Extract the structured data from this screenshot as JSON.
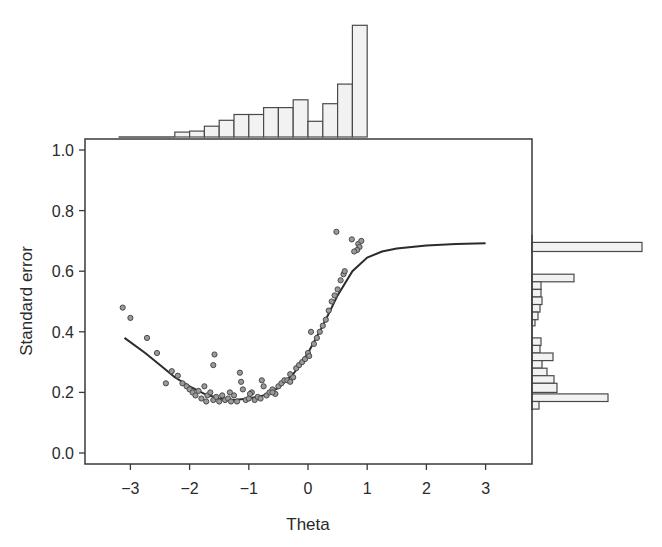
{
  "chart_data": {
    "type": "scatter",
    "title": "",
    "xlabel": "Theta",
    "ylabel": "Standard error",
    "xlim": [
      -3.75,
      3.77
    ],
    "ylim": [
      -0.04,
      1.035
    ],
    "xticks": [
      -3,
      -2,
      -1,
      0,
      1,
      2,
      3
    ],
    "xtick_labels": [
      "−3",
      "−2",
      "−1",
      "0",
      "1",
      "2",
      "3"
    ],
    "yticks": [
      0.0,
      0.2,
      0.4,
      0.6,
      0.8,
      1.0
    ],
    "ytick_labels": [
      "0.0",
      "0.2",
      "0.4",
      "0.6",
      "0.8",
      "1.0"
    ],
    "grid": false,
    "legend": null,
    "curve": {
      "name": "Theoretical standard error",
      "x": [
        -3.1,
        -2.75,
        -2.5,
        -2.25,
        -2.0,
        -1.75,
        -1.5,
        -1.25,
        -1.0,
        -0.75,
        -0.5,
        -0.25,
        0.0,
        0.25,
        0.5,
        0.75,
        1.0,
        1.25,
        1.5,
        2.0,
        2.5,
        3.0
      ],
      "y": [
        0.38,
        0.33,
        0.29,
        0.25,
        0.22,
        0.195,
        0.18,
        0.175,
        0.18,
        0.19,
        0.215,
        0.26,
        0.33,
        0.42,
        0.52,
        0.6,
        0.645,
        0.665,
        0.675,
        0.685,
        0.69,
        0.692
      ]
    },
    "scatter": {
      "name": "Estimated standard error",
      "points": [
        [
          -3.13,
          0.48
        ],
        [
          -3.0,
          0.446
        ],
        [
          -2.72,
          0.38
        ],
        [
          -2.55,
          0.33
        ],
        [
          -2.3,
          0.27
        ],
        [
          -2.2,
          0.255
        ],
        [
          -2.12,
          0.23
        ],
        [
          -2.05,
          0.22
        ],
        [
          -2.0,
          0.21
        ],
        [
          -1.95,
          0.2
        ],
        [
          -1.9,
          0.19
        ],
        [
          -1.85,
          0.205
        ],
        [
          -1.8,
          0.18
        ],
        [
          -1.75,
          0.22
        ],
        [
          -1.7,
          0.19
        ],
        [
          -1.65,
          0.2
        ],
        [
          -1.6,
          0.175
        ],
        [
          -1.58,
          0.325
        ],
        [
          -1.6,
          0.29
        ],
        [
          -1.55,
          0.185
        ],
        [
          -1.5,
          0.17
        ],
        [
          -1.45,
          0.19
        ],
        [
          -1.4,
          0.175
        ],
        [
          -1.35,
          0.18
        ],
        [
          -1.3,
          0.17
        ],
        [
          -1.25,
          0.19
        ],
        [
          -1.2,
          0.17
        ],
        [
          -1.15,
          0.265
        ],
        [
          -1.13,
          0.235
        ],
        [
          -1.1,
          0.21
        ],
        [
          -1.05,
          0.175
        ],
        [
          -1.0,
          0.18
        ],
        [
          -0.95,
          0.2
        ],
        [
          -0.9,
          0.175
        ],
        [
          -0.85,
          0.185
        ],
        [
          -0.8,
          0.18
        ],
        [
          -0.78,
          0.24
        ],
        [
          -0.75,
          0.22
        ],
        [
          -0.7,
          0.19
        ],
        [
          -0.65,
          0.2
        ],
        [
          -0.6,
          0.21
        ],
        [
          -0.55,
          0.195
        ],
        [
          -0.5,
          0.22
        ],
        [
          -0.45,
          0.23
        ],
        [
          -0.4,
          0.24
        ],
        [
          -0.35,
          0.24
        ],
        [
          -0.3,
          0.26
        ],
        [
          -0.25,
          0.25
        ],
        [
          -0.2,
          0.28
        ],
        [
          -0.15,
          0.29
        ],
        [
          -0.1,
          0.3
        ],
        [
          -0.05,
          0.31
        ],
        [
          0.0,
          0.33
        ],
        [
          0.05,
          0.4
        ],
        [
          0.1,
          0.36
        ],
        [
          0.15,
          0.38
        ],
        [
          0.2,
          0.4
        ],
        [
          0.25,
          0.42
        ],
        [
          0.3,
          0.44
        ],
        [
          0.35,
          0.47
        ],
        [
          0.4,
          0.5
        ],
        [
          0.45,
          0.52
        ],
        [
          0.5,
          0.54
        ],
        [
          0.55,
          0.57
        ],
        [
          0.6,
          0.59
        ],
        [
          0.62,
          0.6
        ],
        [
          0.48,
          0.73
        ],
        [
          0.74,
          0.705
        ],
        [
          0.85,
          0.69
        ],
        [
          0.87,
          0.68
        ],
        [
          0.83,
          0.67
        ],
        [
          0.78,
          0.665
        ],
        [
          0.9,
          0.7
        ],
        [
          -2.4,
          0.23
        ],
        [
          -1.72,
          0.17
        ],
        [
          -0.98,
          0.195
        ],
        [
          -0.6,
          0.2
        ],
        [
          -0.3,
          0.235
        ],
        [
          0.02,
          0.32
        ],
        [
          -1.32,
          0.2
        ]
      ]
    },
    "top_histogram": {
      "type": "bar",
      "orientation": "vertical",
      "description": "Distribution of Theta",
      "bin_edges": [
        -2.25,
        -2.0,
        -1.75,
        -1.5,
        -1.25,
        -1.0,
        -0.75,
        -0.5,
        -0.25,
        0.0,
        0.25,
        0.5,
        0.75,
        1.0
      ],
      "heights": [
        5,
        6,
        11,
        17,
        23,
        23,
        30,
        30,
        38,
        16,
        34,
        54,
        114
      ],
      "min_bin_left": -3.2
    },
    "right_histogram": {
      "type": "bar",
      "orientation": "horizontal",
      "description": "Distribution of standard error",
      "bins": [
        {
          "y_top": 0.695,
          "y_bottom": 0.665,
          "width": 110
        },
        {
          "y_top": 0.59,
          "y_bottom": 0.565,
          "width": 42
        },
        {
          "y_top": 0.565,
          "y_bottom": 0.54,
          "width": 9
        },
        {
          "y_top": 0.54,
          "y_bottom": 0.515,
          "width": 9
        },
        {
          "y_top": 0.515,
          "y_bottom": 0.49,
          "width": 10
        },
        {
          "y_top": 0.49,
          "y_bottom": 0.465,
          "width": 8
        },
        {
          "y_top": 0.465,
          "y_bottom": 0.44,
          "width": 6
        },
        {
          "y_top": 0.44,
          "y_bottom": 0.42,
          "width": 3
        },
        {
          "y_top": 0.38,
          "y_bottom": 0.355,
          "width": 9
        },
        {
          "y_top": 0.355,
          "y_bottom": 0.33,
          "width": 8
        },
        {
          "y_top": 0.33,
          "y_bottom": 0.305,
          "width": 21
        },
        {
          "y_top": 0.305,
          "y_bottom": 0.28,
          "width": 10
        },
        {
          "y_top": 0.28,
          "y_bottom": 0.255,
          "width": 15
        },
        {
          "y_top": 0.255,
          "y_bottom": 0.23,
          "width": 22
        },
        {
          "y_top": 0.23,
          "y_bottom": 0.2,
          "width": 25
        },
        {
          "y_top": 0.195,
          "y_bottom": 0.17,
          "width": 76
        },
        {
          "y_top": 0.17,
          "y_bottom": 0.145,
          "width": 7
        }
      ]
    },
    "colors": {
      "axis": "#3a3a3a",
      "curve": "#2b2b2b",
      "point_fill": "#9a9a9a",
      "point_stroke": "#4a4a4a",
      "bar_fill": "#f2f2f2",
      "bar_stroke": "#4a4a4a"
    }
  }
}
